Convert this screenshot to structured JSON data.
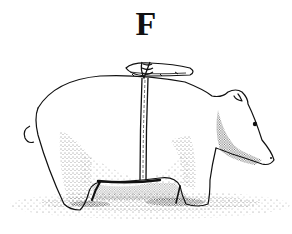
{
  "figure": {
    "label": "F",
    "style": "pen-and-ink stipple illustration",
    "colors": {
      "ink": "#111111",
      "paper": "#ffffff"
    }
  }
}
